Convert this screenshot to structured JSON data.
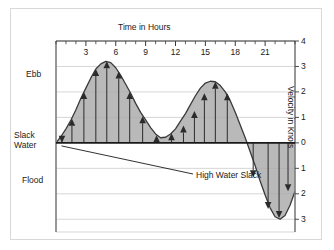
{
  "figure": {
    "background": "#ffffff",
    "border_color": "#d8d8d8"
  },
  "axes": {
    "time_axis_title": "Time in Hours",
    "velocity_axis_title": "Velocity in Knots"
  },
  "zones": {
    "ebb": "Ebb",
    "slack_line1": "Slack",
    "slack_line2": "Water",
    "flood": "Flood"
  },
  "annotation": {
    "high_water_slack": "High Water Slack"
  },
  "chart_data": {
    "type": "line",
    "title": "",
    "subtitle": "",
    "xlabel": "Time in Hours",
    "ylabel": "Velocity in Knots",
    "xlim": [
      0,
      24
    ],
    "ylim": [
      -3.5,
      4
    ],
    "grid": true,
    "legend_position": "none",
    "x_ticks_major": [
      3,
      6,
      9,
      12,
      15,
      18,
      21
    ],
    "x_tick_labels": [
      "3",
      "6",
      "9",
      "12",
      "15",
      "18",
      "21"
    ],
    "x_tick_minor_interval": 1,
    "y_ticks": [
      4,
      3,
      2,
      1,
      0,
      -1,
      -2,
      -3
    ],
    "y_tick_labels": [
      "4",
      "3",
      "2",
      "1",
      "0",
      "1",
      "2",
      "3"
    ],
    "zero_line_value": 0,
    "fill_color": "#a9a9a9",
    "line_color": "#3a3a3a",
    "series": [
      {
        "name": "Tidal current velocity",
        "x": [
          0,
          0.5,
          1,
          1.5,
          2,
          2.5,
          3,
          3.5,
          4,
          4.5,
          5,
          5.5,
          6,
          6.5,
          7,
          7.5,
          8,
          8.5,
          9,
          9.5,
          10,
          10.5,
          11,
          11.5,
          12,
          12.5,
          13,
          13.5,
          14,
          14.5,
          15,
          15.5,
          16,
          16.5,
          17,
          17.5,
          18,
          18.5,
          19,
          19.5,
          20,
          20.5,
          21,
          21.5,
          22,
          22.5,
          23,
          23.5,
          24
        ],
        "values": [
          0,
          0.25,
          0.55,
          0.9,
          1.3,
          1.75,
          2.15,
          2.55,
          2.9,
          3.1,
          3.2,
          3.15,
          2.95,
          2.65,
          2.3,
          1.95,
          1.55,
          1.2,
          0.9,
          0.6,
          0.35,
          0.2,
          0.22,
          0.35,
          0.55,
          0.85,
          1.15,
          1.5,
          1.85,
          2.15,
          2.35,
          2.42,
          2.4,
          2.25,
          2.0,
          1.65,
          1.2,
          0.7,
          0.2,
          -0.35,
          -0.9,
          -1.5,
          -2.05,
          -2.55,
          -2.9,
          -3.0,
          -2.85,
          -2.45,
          -1.9
        ]
      }
    ],
    "arrows": [
      {
        "x": 0.6,
        "value": 0.0,
        "direction": "down"
      },
      {
        "x": 1.6,
        "value": 0.95,
        "direction": "up"
      },
      {
        "x": 2.8,
        "value": 2.0,
        "direction": "up"
      },
      {
        "x": 4.0,
        "value": 2.9,
        "direction": "up"
      },
      {
        "x": 5.1,
        "value": 3.2,
        "direction": "up"
      },
      {
        "x": 6.3,
        "value": 2.8,
        "direction": "up"
      },
      {
        "x": 7.4,
        "value": 2.0,
        "direction": "up"
      },
      {
        "x": 8.7,
        "value": 1.05,
        "direction": "up"
      },
      {
        "x": 10.1,
        "value": 0.3,
        "direction": "up"
      },
      {
        "x": 11.6,
        "value": 0.38,
        "direction": "up"
      },
      {
        "x": 12.8,
        "value": 0.68,
        "direction": "up"
      },
      {
        "x": 13.9,
        "value": 1.25,
        "direction": "up"
      },
      {
        "x": 14.9,
        "value": 1.95,
        "direction": "up"
      },
      {
        "x": 16.0,
        "value": 2.4,
        "direction": "up"
      },
      {
        "x": 17.2,
        "value": 1.95,
        "direction": "up"
      },
      {
        "x": 19.8,
        "value": -1.35,
        "direction": "down"
      },
      {
        "x": 21.3,
        "value": -2.6,
        "direction": "down"
      },
      {
        "x": 22.4,
        "value": -2.95,
        "direction": "down"
      },
      {
        "x": 23.3,
        "value": -1.9,
        "direction": "down"
      }
    ],
    "annotations": [
      {
        "text": "High Water Slack",
        "points_to_x": 0.55,
        "points_to_value": 0.0
      }
    ]
  }
}
